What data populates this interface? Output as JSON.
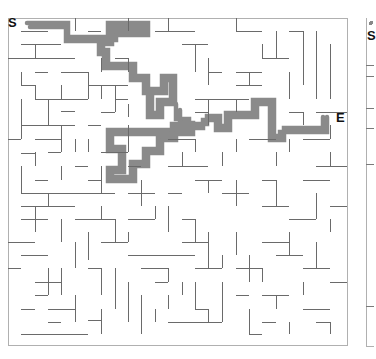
{
  "maze": {
    "start_label": "S",
    "end_label": "E",
    "wall_color": "#666666",
    "border_color": "#aaaaaa",
    "path_color": "#8a8a8a"
  },
  "second_maze": {
    "start_label": "S"
  }
}
